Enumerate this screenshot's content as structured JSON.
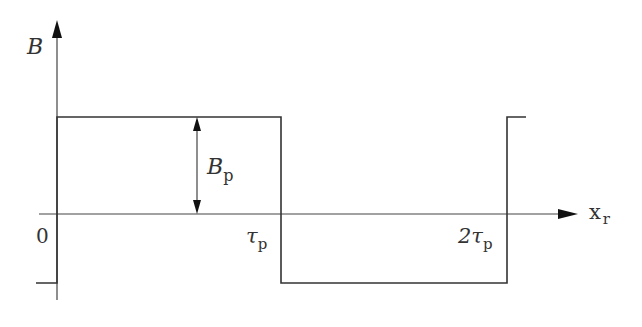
{
  "diagram": {
    "type": "square-wave-flux-density",
    "y_axis": {
      "label": "B"
    },
    "x_axis": {
      "label_main": "x",
      "label_sub": "r"
    },
    "amplitude_label": {
      "main": "B",
      "sub": "p"
    },
    "tick_labels": [
      {
        "id": "origin",
        "main": "0",
        "sub": ""
      },
      {
        "id": "tau",
        "main": "τ",
        "sub": "p"
      },
      {
        "id": "two-tau",
        "main": "2τ",
        "sub": "p"
      }
    ],
    "waveform": {
      "description": "Rectangular wave: +Bp from 0 to τp, −Bp from τp to 2τp, rising again at 2τp",
      "segments": [
        {
          "x_from": "0",
          "x_to": "τp",
          "level": "+Bp"
        },
        {
          "x_from": "τp",
          "x_to": "2τp",
          "level": "-Bp"
        },
        {
          "x_from": "2τp",
          "x_to": "beyond",
          "level": "+Bp"
        }
      ]
    },
    "colors": {
      "line": "#333333",
      "background": "#ffffff"
    }
  }
}
